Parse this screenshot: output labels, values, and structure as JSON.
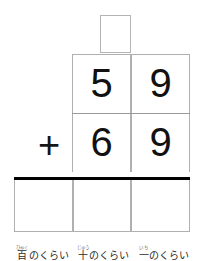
{
  "worksheet": {
    "type": "vertical-addition",
    "carry_box": {
      "value": "",
      "column": "tens"
    },
    "operands": [
      {
        "row": "first-addend",
        "digits": [
          {
            "place": "tens",
            "value": "5"
          },
          {
            "place": "ones",
            "value": "9"
          }
        ]
      },
      {
        "row": "second-addend",
        "operator": "+",
        "digits": [
          {
            "place": "tens",
            "value": "6"
          },
          {
            "place": "ones",
            "value": "9"
          }
        ]
      }
    ],
    "answer_row": {
      "cells": [
        {
          "place": "hundreds",
          "value": ""
        },
        {
          "place": "tens",
          "value": ""
        },
        {
          "place": "ones",
          "value": ""
        }
      ]
    },
    "place_labels": [
      {
        "furigana": "ひゃく",
        "kanji": "百",
        "suffix": "のくらい",
        "full": "百のくらい"
      },
      {
        "furigana": "じゅう",
        "kanji": "十",
        "suffix": "のくらい",
        "full": "十のくらい"
      },
      {
        "furigana": "いち",
        "kanji": "一",
        "suffix": "のくらい",
        "full": "一のくらい"
      }
    ],
    "colors": {
      "grid_line": "#b0b0b0",
      "sum_rule": "#000000",
      "digit": "#111111",
      "label": "#2b2b2b",
      "furigana": "#6a6a6a",
      "background": "#ffffff"
    }
  }
}
